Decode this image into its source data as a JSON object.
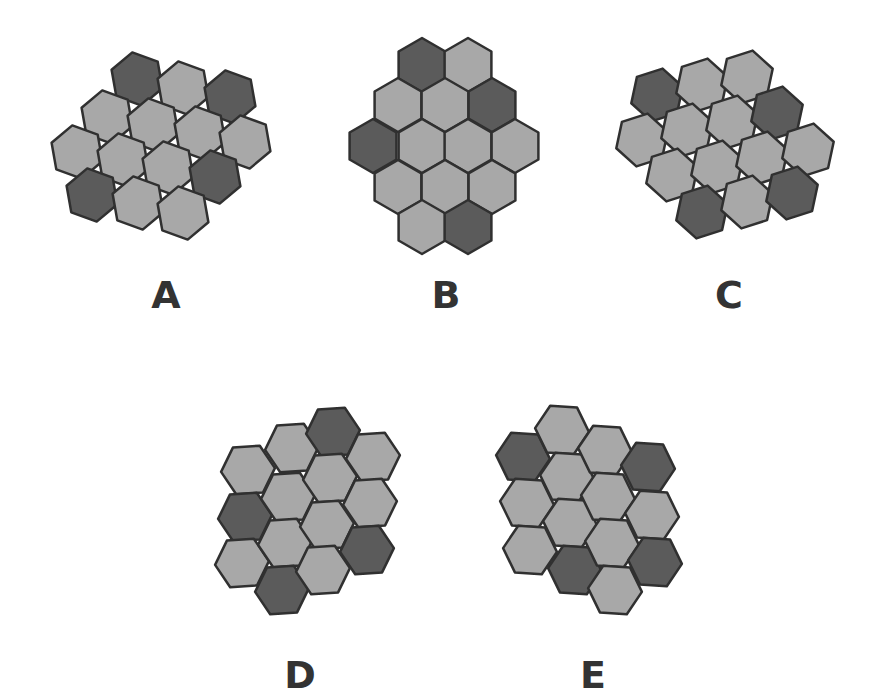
{
  "colors": {
    "light": "#a8a8a8",
    "dark": "#5b5b5b",
    "stroke": "#303030",
    "label": "#333333"
  },
  "hex_radius": 27,
  "figures": [
    {
      "id": "A",
      "label": "A",
      "label_pos": [
        166,
        295
      ],
      "orientation": "pointy",
      "rotation": -10,
      "cells": [
        {
          "c": [
            137,
            79
          ],
          "s": "dark"
        },
        {
          "c": [
            183,
            88
          ],
          "s": "light"
        },
        {
          "c": [
            230,
            97
          ],
          "s": "dark"
        },
        {
          "c": [
            107,
            117
          ],
          "s": "light"
        },
        {
          "c": [
            153,
            125
          ],
          "s": "light"
        },
        {
          "c": [
            200,
            133
          ],
          "s": "light"
        },
        {
          "c": [
            245,
            142
          ],
          "s": "light"
        },
        {
          "c": [
            77,
            152
          ],
          "s": "light"
        },
        {
          "c": [
            123,
            160
          ],
          "s": "light"
        },
        {
          "c": [
            168,
            168
          ],
          "s": "light"
        },
        {
          "c": [
            215,
            177
          ],
          "s": "dark"
        },
        {
          "c": [
            92,
            195
          ],
          "s": "dark"
        },
        {
          "c": [
            138,
            203
          ],
          "s": "light"
        },
        {
          "c": [
            183,
            213
          ],
          "s": "light"
        }
      ]
    },
    {
      "id": "B",
      "label": "B",
      "label_pos": [
        446,
        295
      ],
      "orientation": "pointy",
      "rotation": 0,
      "cells": [
        {
          "c": [
            422,
            65
          ],
          "s": "dark"
        },
        {
          "c": [
            468,
            65
          ],
          "s": "light"
        },
        {
          "c": [
            398,
            105
          ],
          "s": "light"
        },
        {
          "c": [
            445,
            105
          ],
          "s": "light"
        },
        {
          "c": [
            492,
            105
          ],
          "s": "dark"
        },
        {
          "c": [
            373,
            146
          ],
          "s": "dark"
        },
        {
          "c": [
            422,
            146
          ],
          "s": "light"
        },
        {
          "c": [
            468,
            146
          ],
          "s": "light"
        },
        {
          "c": [
            515,
            146
          ],
          "s": "light"
        },
        {
          "c": [
            398,
            187
          ],
          "s": "light"
        },
        {
          "c": [
            445,
            187
          ],
          "s": "light"
        },
        {
          "c": [
            492,
            187
          ],
          "s": "light"
        },
        {
          "c": [
            422,
            227
          ],
          "s": "light"
        },
        {
          "c": [
            468,
            227
          ],
          "s": "dark"
        }
      ]
    },
    {
      "id": "C",
      "label": "C",
      "label_pos": [
        729,
        295
      ],
      "orientation": "pointy",
      "rotation": 12,
      "cells": [
        {
          "c": [
            657,
            95
          ],
          "s": "dark"
        },
        {
          "c": [
            702,
            85
          ],
          "s": "light"
        },
        {
          "c": [
            747,
            77
          ],
          "s": "light"
        },
        {
          "c": [
            642,
            140
          ],
          "s": "light"
        },
        {
          "c": [
            687,
            130
          ],
          "s": "light"
        },
        {
          "c": [
            732,
            122
          ],
          "s": "light"
        },
        {
          "c": [
            777,
            113
          ],
          "s": "dark"
        },
        {
          "c": [
            672,
            175
          ],
          "s": "light"
        },
        {
          "c": [
            717,
            167
          ],
          "s": "light"
        },
        {
          "c": [
            762,
            158
          ],
          "s": "light"
        },
        {
          "c": [
            808,
            150
          ],
          "s": "light"
        },
        {
          "c": [
            702,
            212
          ],
          "s": "dark"
        },
        {
          "c": [
            747,
            202
          ],
          "s": "light"
        },
        {
          "c": [
            792,
            193
          ],
          "s": "dark"
        }
      ]
    },
    {
      "id": "D",
      "label": "D",
      "label_pos": [
        300,
        675
      ],
      "orientation": "flat",
      "rotation": -4,
      "cells": [
        {
          "c": [
            248,
            470
          ],
          "s": "light"
        },
        {
          "c": [
            245,
            517
          ],
          "s": "dark"
        },
        {
          "c": [
            242,
            563
          ],
          "s": "light"
        },
        {
          "c": [
            292,
            448
          ],
          "s": "light"
        },
        {
          "c": [
            288,
            497
          ],
          "s": "light"
        },
        {
          "c": [
            285,
            543
          ],
          "s": "light"
        },
        {
          "c": [
            282,
            590
          ],
          "s": "dark"
        },
        {
          "c": [
            333,
            432
          ],
          "s": "dark"
        },
        {
          "c": [
            330,
            478
          ],
          "s": "light"
        },
        {
          "c": [
            327,
            525
          ],
          "s": "light"
        },
        {
          "c": [
            323,
            570
          ],
          "s": "light"
        },
        {
          "c": [
            373,
            457
          ],
          "s": "light"
        },
        {
          "c": [
            370,
            503
          ],
          "s": "light"
        },
        {
          "c": [
            367,
            550
          ],
          "s": "dark"
        }
      ]
    },
    {
      "id": "E",
      "label": "E",
      "label_pos": [
        593,
        675
      ],
      "orientation": "flat",
      "rotation": 4,
      "cells": [
        {
          "c": [
            523,
            457
          ],
          "s": "dark"
        },
        {
          "c": [
            527,
            503
          ],
          "s": "light"
        },
        {
          "c": [
            530,
            550
          ],
          "s": "light"
        },
        {
          "c": [
            562,
            430
          ],
          "s": "light"
        },
        {
          "c": [
            567,
            477
          ],
          "s": "light"
        },
        {
          "c": [
            570,
            523
          ],
          "s": "light"
        },
        {
          "c": [
            575,
            570
          ],
          "s": "dark"
        },
        {
          "c": [
            605,
            450
          ],
          "s": "light"
        },
        {
          "c": [
            608,
            497
          ],
          "s": "light"
        },
        {
          "c": [
            612,
            543
          ],
          "s": "light"
        },
        {
          "c": [
            615,
            590
          ],
          "s": "light"
        },
        {
          "c": [
            648,
            467
          ],
          "s": "dark"
        },
        {
          "c": [
            652,
            515
          ],
          "s": "light"
        },
        {
          "c": [
            655,
            562
          ],
          "s": "dark"
        }
      ]
    }
  ]
}
